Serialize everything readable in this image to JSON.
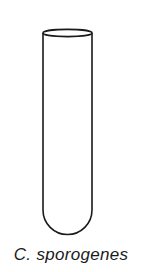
{
  "figure": {
    "label": "C. sporogenes",
    "object": "test-tube",
    "colors": {
      "stroke": "#1a1a1a",
      "background": "#ffffff"
    }
  }
}
